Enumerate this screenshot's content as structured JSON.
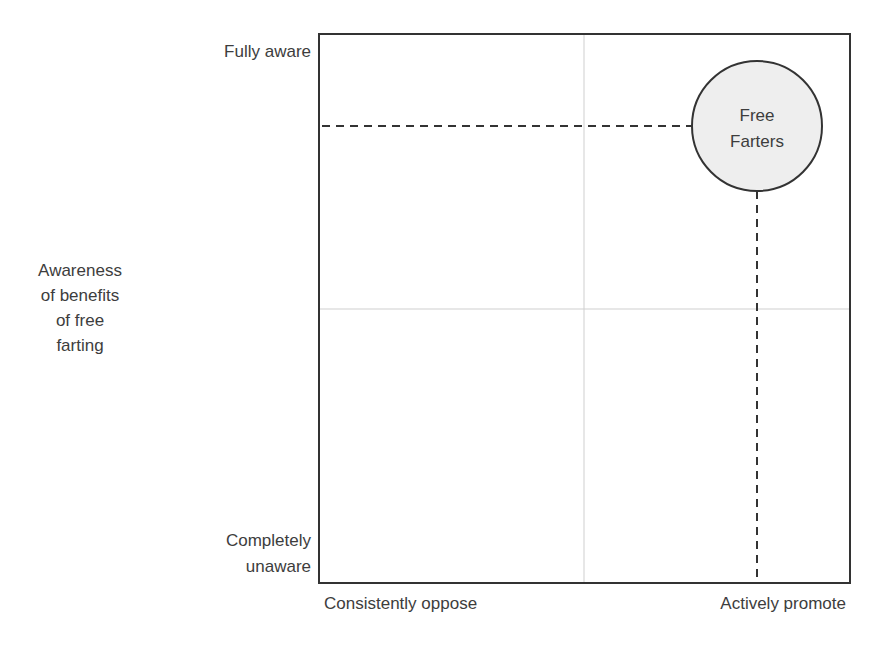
{
  "diagram": {
    "type": "quadrant",
    "y_axis": {
      "title_lines": [
        "Awareness",
        "of benefits",
        "of free",
        "farting"
      ],
      "top_label": "Fully aware",
      "bottom_label_lines": [
        "Completely",
        "unaware"
      ]
    },
    "x_axis": {
      "left_label": "Consistently oppose",
      "right_label": "Actively promote"
    },
    "bubble": {
      "label_lines": [
        "Free",
        "Farters"
      ],
      "fill": "#eeeeee",
      "stroke": "#333333"
    },
    "colors": {
      "frame": "#333333",
      "gridline": "#cccccc",
      "dashed": "#333333"
    }
  }
}
